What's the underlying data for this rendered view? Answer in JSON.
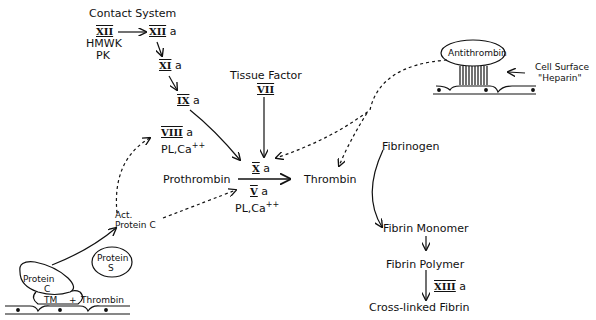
{
  "contact_system": {
    "title": "Contact System",
    "xii": "XII",
    "xiia": "XII",
    "a": "a",
    "hmwk": "HMWK",
    "pk": "PK",
    "xia": "XI",
    "ixa": "IX"
  },
  "tissue_factor": {
    "title": "Tissue Factor",
    "vii": "VII"
  },
  "viiia": {
    "roman": "VIII",
    "suffix": "a",
    "cofactors": "PL,Ca",
    "charge": "++"
  },
  "center": {
    "xa": "X",
    "xa_suffix": "a",
    "prothrombin": "Prothrombin",
    "thrombin": "Thrombin",
    "va": "V",
    "va_suffix": "a",
    "cofactors": "PL,Ca",
    "charge": "++"
  },
  "antithrombin": {
    "label": "Antithrombin",
    "cell_surface": "Cell Surface",
    "heparin": "\"Heparin\""
  },
  "protein_c": {
    "act_line1": "Act.",
    "act_line2": "Protein C",
    "protein_s_line1": "Protein",
    "protein_s_line2": "S",
    "protein_c_line1": "Protein",
    "protein_c_line2": "C",
    "tm": "TM",
    "plus": "+",
    "thrombin": "Thrombin"
  },
  "fibrin": {
    "fibrinogen": "Fibrinogen",
    "monomer": "Fibrin Monomer",
    "polymer": "Fibrin Polymer",
    "xiiia": "XIII",
    "xiiia_suffix": "a",
    "crosslinked": "Cross-linked Fibrin"
  }
}
